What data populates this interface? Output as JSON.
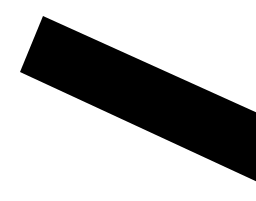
{
  "canvas": {
    "width": 256,
    "height": 201,
    "background": "#ffffff"
  },
  "shape": {
    "fill": "#000000",
    "points": "43,16 262,115 262,184 20,72"
  }
}
